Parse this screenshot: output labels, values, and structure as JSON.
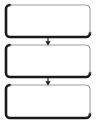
{
  "diagram": {
    "type": "flowchart",
    "orientation": "vertical",
    "title": "",
    "background_color": "#ffffff",
    "canvas": {
      "width": 99,
      "height": 126
    },
    "style": {
      "node_shape": "rounded-rectangle",
      "node_fill": "#ffffff",
      "node_corner_radius": 4,
      "node_border_light_color": "#9a9a9a",
      "node_border_dark_color": "#1a1a1a",
      "node_border_light_width": 1,
      "node_border_dark_width": 2.6,
      "shadow_effect": "bevel-left-bottom",
      "connector_color": "#1a1a1a",
      "connector_style": "solid-line-with-filled-arrowhead"
    },
    "nodes": [
      {
        "id": "node-1",
        "label": "",
        "x": 6,
        "y": 5,
        "width": 84,
        "height": 32
      },
      {
        "id": "node-2",
        "label": "",
        "x": 6,
        "y": 45,
        "width": 84,
        "height": 32
      },
      {
        "id": "node-3",
        "label": "",
        "x": 6,
        "y": 85,
        "width": 84,
        "height": 33
      }
    ],
    "connectors": [
      {
        "id": "connector-1",
        "label": "",
        "from": "node-1",
        "to": "node-2",
        "direction": "down",
        "x": 48,
        "y_start": 37,
        "y_end": 45
      },
      {
        "id": "connector-2",
        "label": "",
        "from": "node-2",
        "to": "node-3",
        "direction": "down",
        "x": 48,
        "y_start": 77,
        "y_end": 85
      }
    ]
  }
}
